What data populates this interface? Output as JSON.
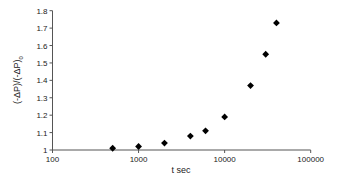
{
  "chart_data": {
    "type": "scatter",
    "title": "",
    "xlabel": "t sec",
    "ylabel": "(-ΔP)/(-ΔP)",
    "ylabel_subscript": "0",
    "xscale": "log",
    "xlim": [
      100,
      100000
    ],
    "ylim": [
      1,
      1.8
    ],
    "grid": false,
    "legend": null,
    "x_ticks": [
      "100",
      "1000",
      "10000",
      "100000"
    ],
    "y_ticks": [
      "1",
      "1.1",
      "1.2",
      "1.3",
      "1.4",
      "1.5",
      "1.6",
      "1.7",
      "1.8"
    ],
    "marker": "diamond",
    "marker_color": "#000000",
    "series": [
      {
        "name": "data",
        "x": [
          500,
          1000,
          2000,
          4000,
          6000,
          10000,
          20000,
          30000,
          40000
        ],
        "y": [
          1.01,
          1.02,
          1.04,
          1.08,
          1.11,
          1.19,
          1.37,
          1.55,
          1.73
        ]
      }
    ]
  }
}
